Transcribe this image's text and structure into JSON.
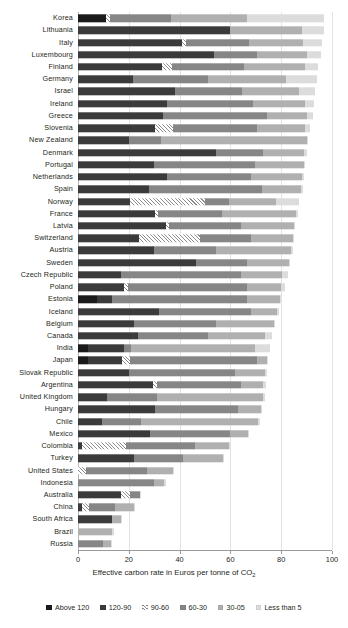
{
  "chart_data": {
    "type": "bar",
    "orientation": "horizontal",
    "stacked": true,
    "title": "",
    "xlabel": "Effective carbon rate in Euros per tonne of CO2",
    "xlabel_display": "Effective carbon rate in Euros per tonne of CO",
    "xlabel_sub": "2",
    "ylabel": "",
    "xlim": [
      0,
      100
    ],
    "xticks": [
      0,
      20,
      40,
      60,
      80,
      100
    ],
    "xtick_labels": [
      "0",
      "20",
      "40",
      "60",
      "80",
      "100"
    ],
    "grid": true,
    "legend_position": "bottom",
    "legend": [
      "Above 120",
      "120-90",
      "90-60",
      "60-30",
      "30-05",
      "Less than 5"
    ],
    "series": [
      {
        "name": "Above 120",
        "color": "#1b1b1b",
        "pattern": "solid"
      },
      {
        "name": "120-90",
        "color": "#3b3b3b",
        "pattern": "solid"
      },
      {
        "name": "90-60",
        "color": "#8c8c8c",
        "pattern": "diagonal-hatch"
      },
      {
        "name": "60-30",
        "color": "#868686",
        "pattern": "solid"
      },
      {
        "name": "30-05",
        "color": "#b0b0b0",
        "pattern": "solid"
      },
      {
        "name": "Less than 5",
        "color": "#dcdcdc",
        "pattern": "solid"
      }
    ],
    "categories": [
      "Korea",
      "Lithuania",
      "Italy",
      "Luxembourg",
      "Finland",
      "Germany",
      "Israel",
      "Ireland",
      "Greece",
      "Slovenia",
      "New Zealand",
      "Denmark",
      "Portugal",
      "Netherlands",
      "Spain",
      "Norway",
      "France",
      "Latvia",
      "Switzerland",
      "Austria",
      "Sweden",
      "Czech Republic",
      "Poland",
      "Estonia",
      "Iceland",
      "Belgium",
      "Canada",
      "India",
      "Japan",
      "Slovak Republic",
      "Argentina",
      "United Kingdom",
      "Hungary",
      "Chile",
      "Mexico",
      "Colombia",
      "Turkey",
      "United States",
      "Indonesia",
      "Australia",
      "China",
      "South Africa",
      "Brazil",
      "Russia"
    ],
    "rows": [
      {
        "category": "Korea",
        "values": [
          11.0,
          0.0,
          1.5,
          24.0,
          30.0,
          30.5
        ],
        "total": 97.0
      },
      {
        "category": "Lithuania",
        "values": [
          0.0,
          60.0,
          0.0,
          0.0,
          28.0,
          9.0
        ],
        "total": 97.0
      },
      {
        "category": "Italy",
        "values": [
          0.0,
          41.0,
          1.5,
          25.0,
          21.0,
          7.5
        ],
        "total": 96.0
      },
      {
        "category": "Luxembourg",
        "values": [
          0.0,
          53.5,
          0.0,
          17.0,
          19.5,
          5.5
        ],
        "total": 95.5
      },
      {
        "category": "Finland",
        "values": [
          0.0,
          33.0,
          4.0,
          28.5,
          24.0,
          5.0
        ],
        "total": 94.5
      },
      {
        "category": "Germany",
        "values": [
          0.0,
          21.5,
          0.0,
          29.5,
          31.0,
          12.0
        ],
        "total": 94.0
      },
      {
        "category": "Israel",
        "values": [
          0.0,
          38.0,
          0.0,
          26.5,
          22.5,
          6.5
        ],
        "total": 93.5
      },
      {
        "category": "Ireland",
        "values": [
          0.0,
          35.0,
          0.0,
          34.0,
          20.5,
          3.5
        ],
        "total": 93.0
      },
      {
        "category": "Greece",
        "values": [
          0.0,
          33.5,
          0.0,
          41.0,
          15.5,
          2.5
        ],
        "total": 92.5
      },
      {
        "category": "Slovenia",
        "values": [
          0.0,
          30.5,
          7.0,
          33.0,
          19.0,
          2.0
        ],
        "total": 91.5
      },
      {
        "category": "New Zealand",
        "values": [
          0.0,
          20.0,
          0.0,
          12.5,
          57.5,
          0.5
        ],
        "total": 90.5
      },
      {
        "category": "Denmark",
        "values": [
          0.0,
          54.5,
          0.0,
          18.5,
          16.0,
          1.0
        ],
        "total": 90.0
      },
      {
        "category": "Portugal",
        "values": [
          0.0,
          30.0,
          0.0,
          39.5,
          19.5,
          0.5
        ],
        "total": 89.5
      },
      {
        "category": "Netherlands",
        "values": [
          0.0,
          35.0,
          0.0,
          33.0,
          20.0,
          1.0
        ],
        "total": 89.0
      },
      {
        "category": "Spain",
        "values": [
          0.0,
          28.0,
          0.0,
          44.5,
          15.5,
          0.5
        ],
        "total": 88.5
      },
      {
        "category": "Norway",
        "values": [
          0.0,
          20.5,
          29.5,
          9.5,
          18.5,
          9.0
        ],
        "total": 87.0
      },
      {
        "category": "France",
        "values": [
          0.0,
          30.5,
          1.0,
          25.0,
          29.5,
          0.5
        ],
        "total": 86.5
      },
      {
        "category": "Latvia",
        "values": [
          0.0,
          34.5,
          1.5,
          28.0,
          21.0,
          0.5
        ],
        "total": 85.5
      },
      {
        "category": "Switzerland",
        "values": [
          0.0,
          24.0,
          24.0,
          20.0,
          16.5,
          0.5
        ],
        "total": 85.0
      },
      {
        "category": "Austria",
        "values": [
          0.0,
          30.0,
          0.0,
          24.5,
          29.5,
          0.5
        ],
        "total": 84.5
      },
      {
        "category": "Sweden",
        "values": [
          0.0,
          46.5,
          0.0,
          20.0,
          16.5,
          0.5
        ],
        "total": 83.5
      },
      {
        "category": "Czech Republic",
        "values": [
          0.0,
          17.0,
          0.0,
          47.0,
          16.5,
          2.0
        ],
        "total": 82.5
      },
      {
        "category": "Poland",
        "values": [
          0.0,
          18.0,
          1.5,
          47.0,
          13.5,
          1.5
        ],
        "total": 81.5
      },
      {
        "category": "Estonia",
        "values": [
          7.5,
          6.0,
          0.0,
          53.0,
          13.0,
          0.5
        ],
        "total": 80.0
      },
      {
        "category": "Iceland",
        "values": [
          0.0,
          32.0,
          0.0,
          36.0,
          10.5,
          0.5
        ],
        "total": 79.0
      },
      {
        "category": "Belgium",
        "values": [
          0.0,
          22.0,
          0.0,
          32.5,
          22.5,
          0.5
        ],
        "total": 77.5
      },
      {
        "category": "Canada",
        "values": [
          0.0,
          23.5,
          0.0,
          27.5,
          22.5,
          3.0
        ],
        "total": 76.5
      },
      {
        "category": "India",
        "values": [
          4.0,
          14.0,
          0.0,
          3.0,
          48.5,
          6.0
        ],
        "total": 75.5
      },
      {
        "category": "Japan",
        "values": [
          4.0,
          13.5,
          3.0,
          50.0,
          4.0,
          0.5
        ],
        "total": 75.0
      },
      {
        "category": "Slovak Republic",
        "values": [
          0.0,
          20.0,
          0.0,
          42.0,
          11.5,
          1.0
        ],
        "total": 74.5
      },
      {
        "category": "Argentina",
        "values": [
          0.0,
          29.5,
          1.5,
          33.0,
          9.0,
          1.0
        ],
        "total": 74.0
      },
      {
        "category": "United Kingdom",
        "values": [
          0.0,
          11.5,
          0.0,
          19.5,
          42.0,
          0.5
        ],
        "total": 73.5
      },
      {
        "category": "Hungary",
        "values": [
          0.0,
          30.5,
          0.0,
          32.5,
          9.0,
          0.5
        ],
        "total": 72.5
      },
      {
        "category": "Chile",
        "values": [
          0.0,
          9.5,
          0.0,
          15.5,
          46.0,
          0.5
        ],
        "total": 71.5
      },
      {
        "category": "Mexico",
        "values": [
          0.0,
          28.5,
          0.0,
          31.5,
          7.0,
          0.5
        ],
        "total": 67.5
      },
      {
        "category": "Colombia",
        "values": [
          0.0,
          1.5,
          17.5,
          27.0,
          13.5,
          0.5
        ],
        "total": 60.0
      },
      {
        "category": "Turkey",
        "values": [
          0.0,
          22.0,
          0.0,
          19.5,
          15.5,
          0.5
        ],
        "total": 57.5
      },
      {
        "category": "United States",
        "values": [
          0.0,
          0.0,
          3.0,
          24.0,
          10.5,
          0.5
        ],
        "total": 38.0
      },
      {
        "category": "Indonesia",
        "values": [
          0.0,
          0.0,
          0.0,
          30.0,
          4.0,
          0.5
        ],
        "total": 34.5
      },
      {
        "category": "Australia",
        "values": [
          0.0,
          17.0,
          3.5,
          4.0,
          0.0,
          0.5
        ],
        "total": 25.0
      },
      {
        "category": "China",
        "values": [
          0.0,
          1.5,
          3.0,
          10.0,
          7.5,
          0.5
        ],
        "total": 22.5
      },
      {
        "category": "South Africa",
        "values": [
          0.0,
          13.5,
          0.0,
          0.0,
          3.5,
          0.5
        ],
        "total": 17.5
      },
      {
        "category": "Brazil",
        "values": [
          0.0,
          0.0,
          0.0,
          0.0,
          13.5,
          0.5
        ],
        "total": 14.0
      },
      {
        "category": "Russia",
        "values": [
          0.0,
          0.0,
          0.0,
          10.0,
          3.0,
          0.5
        ],
        "total": 13.5
      }
    ]
  }
}
